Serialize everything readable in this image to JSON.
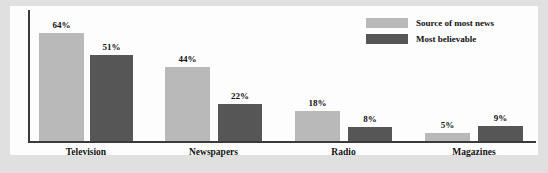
{
  "chart_data": {
    "type": "bar",
    "title": "",
    "xlabel": "",
    "ylabel": "",
    "ylim": [
      0,
      70
    ],
    "grid": false,
    "legend_position": "top-right",
    "categories": [
      "Television",
      "Newspapers",
      "Radio",
      "Magazines"
    ],
    "series": [
      {
        "name": "Source of most news",
        "color": "#b9b9b9",
        "values": [
          64,
          44,
          18,
          5
        ],
        "labels": [
          "64%",
          "44%",
          "18%",
          "5%"
        ]
      },
      {
        "name": "Most believable",
        "color": "#565656",
        "values": [
          51,
          22,
          8,
          9
        ],
        "labels": [
          "51%",
          "22%",
          "8%",
          "9%"
        ]
      }
    ]
  },
  "legend": {
    "items": [
      {
        "label": "Source of most news",
        "swatch": "#b9b9b9"
      },
      {
        "label": "Most believable",
        "swatch": "#565656"
      }
    ]
  },
  "axis": {
    "baseline_color": "#3a3a3a",
    "y_axis_color": "#3a3a3a"
  },
  "figure": {
    "background": "#e0e0e0",
    "plot_background": "#fdfdfd"
  }
}
